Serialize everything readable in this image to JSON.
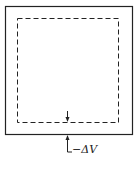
{
  "diagram": {
    "label": "−ΔV",
    "colors": {
      "stroke": "#222222",
      "background": "#ffffff"
    },
    "elements": [
      {
        "type": "solid-rectangle",
        "role": "outer-boundary"
      },
      {
        "type": "dashed-rectangle",
        "role": "inner-boundary"
      },
      {
        "type": "arrow",
        "role": "inward-arrow-to-dashed-boundary"
      },
      {
        "type": "arrow",
        "role": "arrow-up-to-outer-boundary-with-label"
      }
    ]
  }
}
